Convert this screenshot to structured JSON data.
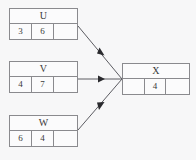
{
  "diagram": {
    "type": "dataflow-merge-diagram",
    "background_color": "#f7f7f8",
    "border_color": "#8a8a8e",
    "text_color": "#3a3a3a",
    "arrow_color": "#5c5c62",
    "nodes": [
      {
        "id": "U",
        "title": "U",
        "cells": [
          "3",
          "6",
          ""
        ]
      },
      {
        "id": "V",
        "title": "V",
        "cells": [
          "4",
          "7",
          ""
        ]
      },
      {
        "id": "W",
        "title": "W",
        "cells": [
          "6",
          "4",
          ""
        ]
      },
      {
        "id": "X",
        "title": "X",
        "cells": [
          "",
          "4",
          ""
        ]
      }
    ],
    "edges": [
      {
        "from": "U",
        "to": "X"
      },
      {
        "from": "V",
        "to": "X"
      },
      {
        "from": "W",
        "to": "X"
      }
    ]
  }
}
